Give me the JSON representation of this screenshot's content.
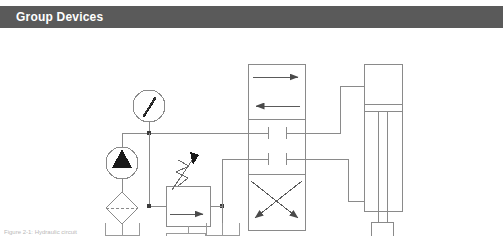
{
  "header": {
    "title": "Group Devices",
    "bg_color": "#5a5a5a",
    "text_color": "#ffffff"
  },
  "caption": {
    "text": "Figure 2-1: Hydraulic circuit"
  },
  "diagram": {
    "name": "hydraulic-circuit-schematic",
    "line_color": "#7a7a7a",
    "fill_color": "#000000",
    "background": "#ffffff",
    "components": [
      {
        "id": "pressure-gauge",
        "label": "Pressure Gauge",
        "symbol": "circle-with-needle",
        "cx": 149,
        "cy": 78,
        "r": 16
      },
      {
        "id": "pump",
        "label": "Hydraulic Pump",
        "symbol": "circle-with-filled-triangle",
        "cx": 122,
        "cy": 135,
        "r": 16
      },
      {
        "id": "filter",
        "label": "Filter / Strainer",
        "symbol": "diamond-with-dashed-line",
        "cx": 122,
        "cy": 180,
        "half": 16
      },
      {
        "id": "relief-valve",
        "label": "Pressure Relief Valve",
        "symbol": "box-with-arrow-and-adjustable-spring",
        "x": 166,
        "y": 158,
        "w": 44,
        "h": 40
      },
      {
        "id": "directional-control-valve",
        "label": "4/3 Directional Control Valve",
        "symbol": "three-position-valve",
        "x": 248,
        "y": 36,
        "w": 57,
        "h": 166,
        "positions": [
          {
            "name": "parallel-arrows",
            "description": "straight through flow"
          },
          {
            "name": "blocked-center",
            "description": "closed center"
          },
          {
            "name": "crossed-arrows",
            "description": "crossed flow"
          }
        ]
      },
      {
        "id": "cylinder",
        "label": "Double Acting Cylinder",
        "symbol": "vertical-cylinder-with-rod",
        "x": 364,
        "y": 36,
        "w": 38,
        "h": 128
      },
      {
        "id": "load-block",
        "label": "Load",
        "symbol": "square-block",
        "x": 371,
        "y": 207,
        "w": 22,
        "h": 20
      },
      {
        "id": "tank-left",
        "label": "Reservoir (pump suction)",
        "symbol": "open-tank",
        "cx": 122,
        "y": 215
      },
      {
        "id": "tank-relief",
        "label": "Reservoir (relief drain)",
        "symbol": "open-tank",
        "cx": 188,
        "y": 213
      },
      {
        "id": "tank-valve",
        "label": "Reservoir (valve tank port)",
        "symbol": "open-tank",
        "cx": 222,
        "y": 215
      }
    ]
  }
}
